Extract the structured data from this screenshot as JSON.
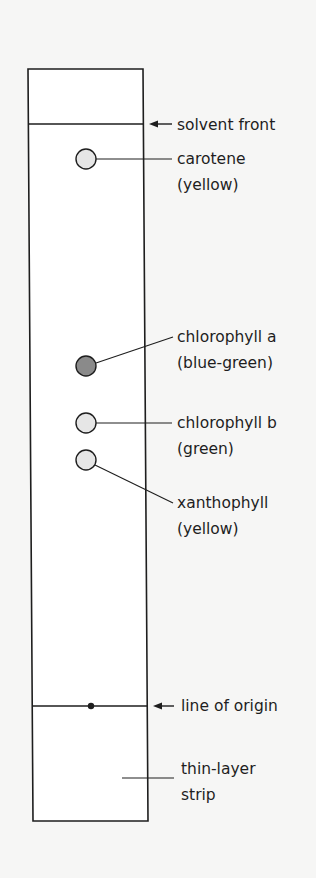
{
  "diagram": {
    "colors": {
      "background": "#f6f6f5",
      "strip_fill": "#ffffff",
      "line": "#1e1e1e",
      "spot_light": "#e6e6e6",
      "spot_dark": "#8a8a8a"
    },
    "labels": {
      "solvent_front": "solvent front",
      "line_of_origin": "line of origin",
      "strip_line1": "thin-layer",
      "strip_line2": "strip"
    },
    "spots": [
      {
        "id": "carotene",
        "name": "carotene",
        "color_text": "(yellow)",
        "shade": "light"
      },
      {
        "id": "chlorophyll-a",
        "name": "chlorophyll a",
        "color_text": "(blue-green)",
        "shade": "dark"
      },
      {
        "id": "chlorophyll-b",
        "name": "chlorophyll b",
        "color_text": "(green)",
        "shade": "light"
      },
      {
        "id": "xanthophyll",
        "name": "xanthophyll",
        "color_text": "(yellow)",
        "shade": "light"
      }
    ]
  }
}
